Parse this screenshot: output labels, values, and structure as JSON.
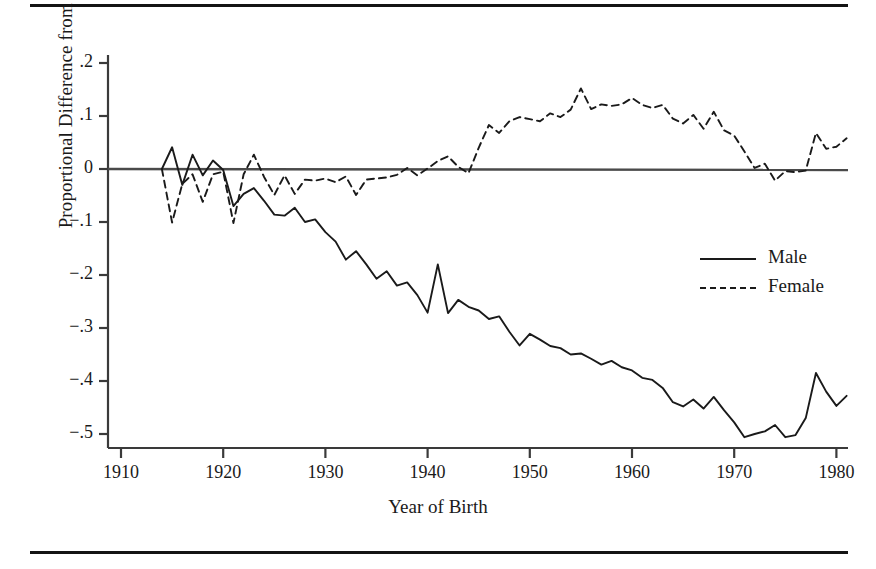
{
  "figure": {
    "rules": [
      "top-rule",
      "bottom-rule"
    ]
  },
  "chart_data": {
    "type": "line",
    "title": "",
    "xlabel": "Year of Birth",
    "ylabel": "Proportional Difference from 1914 Cohort",
    "xlim": [
      1908,
      1983
    ],
    "ylim": [
      -0.53,
      0.23
    ],
    "xticks": [
      1910,
      1920,
      1930,
      1940,
      1950,
      1960,
      1970,
      1980
    ],
    "xtick_labels": [
      "1910",
      "1920",
      "1930",
      "1940",
      "1950",
      "1960",
      "1970",
      "1980"
    ],
    "yticks": [
      0.2,
      0.1,
      0,
      -0.1,
      -0.2,
      -0.3,
      -0.4,
      -0.5
    ],
    "ytick_labels": [
      ".2",
      ".1",
      "0",
      "−.1",
      "−.2",
      "−.3",
      "−.4",
      "−.5"
    ],
    "grid": false,
    "zero_line": 0,
    "legend_position": "right-middle",
    "x": [
      1914,
      1915,
      1916,
      1917,
      1918,
      1919,
      1920,
      1921,
      1922,
      1923,
      1924,
      1925,
      1926,
      1927,
      1928,
      1929,
      1930,
      1931,
      1932,
      1933,
      1934,
      1935,
      1936,
      1937,
      1938,
      1939,
      1940,
      1941,
      1942,
      1943,
      1944,
      1945,
      1946,
      1947,
      1948,
      1949,
      1950,
      1951,
      1952,
      1953,
      1954,
      1955,
      1956,
      1957,
      1958,
      1959,
      1960,
      1961,
      1962,
      1963,
      1964,
      1965,
      1966,
      1967,
      1968,
      1969,
      1970,
      1971,
      1972,
      1973,
      1974,
      1975,
      1976,
      1977,
      1978,
      1979,
      1980,
      1981
    ],
    "series": [
      {
        "name": "Male",
        "style": "solid",
        "color": "#1a1a1a",
        "values": [
          0.0,
          0.041,
          -0.03,
          0.027,
          -0.012,
          0.016,
          -0.002,
          -0.07,
          -0.047,
          -0.036,
          -0.06,
          -0.086,
          -0.088,
          -0.073,
          -0.1,
          -0.095,
          -0.119,
          -0.137,
          -0.171,
          -0.155,
          -0.18,
          -0.207,
          -0.193,
          -0.22,
          -0.214,
          -0.238,
          -0.271,
          -0.18,
          -0.272,
          -0.247,
          -0.26,
          -0.267,
          -0.283,
          -0.278,
          -0.307,
          -0.333,
          -0.311,
          -0.322,
          -0.334,
          -0.338,
          -0.35,
          -0.348,
          -0.358,
          -0.369,
          -0.362,
          -0.374,
          -0.38,
          -0.394,
          -0.398,
          -0.413,
          -0.44,
          -0.448,
          -0.435,
          -0.452,
          -0.43,
          -0.455,
          -0.478,
          -0.506,
          -0.5,
          -0.495,
          -0.483,
          -0.506,
          -0.502,
          -0.47,
          -0.385,
          -0.42,
          -0.447,
          -0.428
        ]
      },
      {
        "name": "Female",
        "style": "dashed",
        "color": "#1a1a1a",
        "values": [
          0.0,
          -0.101,
          -0.028,
          -0.01,
          -0.062,
          -0.01,
          -0.005,
          -0.102,
          -0.01,
          0.027,
          -0.015,
          -0.049,
          -0.012,
          -0.047,
          -0.02,
          -0.022,
          -0.018,
          -0.025,
          -0.014,
          -0.049,
          -0.02,
          -0.018,
          -0.016,
          -0.011,
          0.002,
          -0.012,
          0.001,
          0.015,
          0.024,
          0.004,
          -0.008,
          0.04,
          0.083,
          0.068,
          0.09,
          0.098,
          0.094,
          0.09,
          0.105,
          0.098,
          0.112,
          0.152,
          0.113,
          0.122,
          0.119,
          0.122,
          0.134,
          0.121,
          0.115,
          0.121,
          0.095,
          0.086,
          0.102,
          0.076,
          0.108,
          0.073,
          0.063,
          0.033,
          0.002,
          0.01,
          -0.022,
          -0.004,
          -0.006,
          -0.003,
          0.068,
          0.038,
          0.042,
          0.058
        ]
      }
    ]
  },
  "axis": {
    "y_title": "Proportional Difference from 1914 Cohort",
    "x_title": "Year of Birth"
  },
  "legend": {
    "entries": [
      {
        "label": "Male",
        "style": "solid"
      },
      {
        "label": "Female",
        "style": "dashed"
      }
    ]
  }
}
